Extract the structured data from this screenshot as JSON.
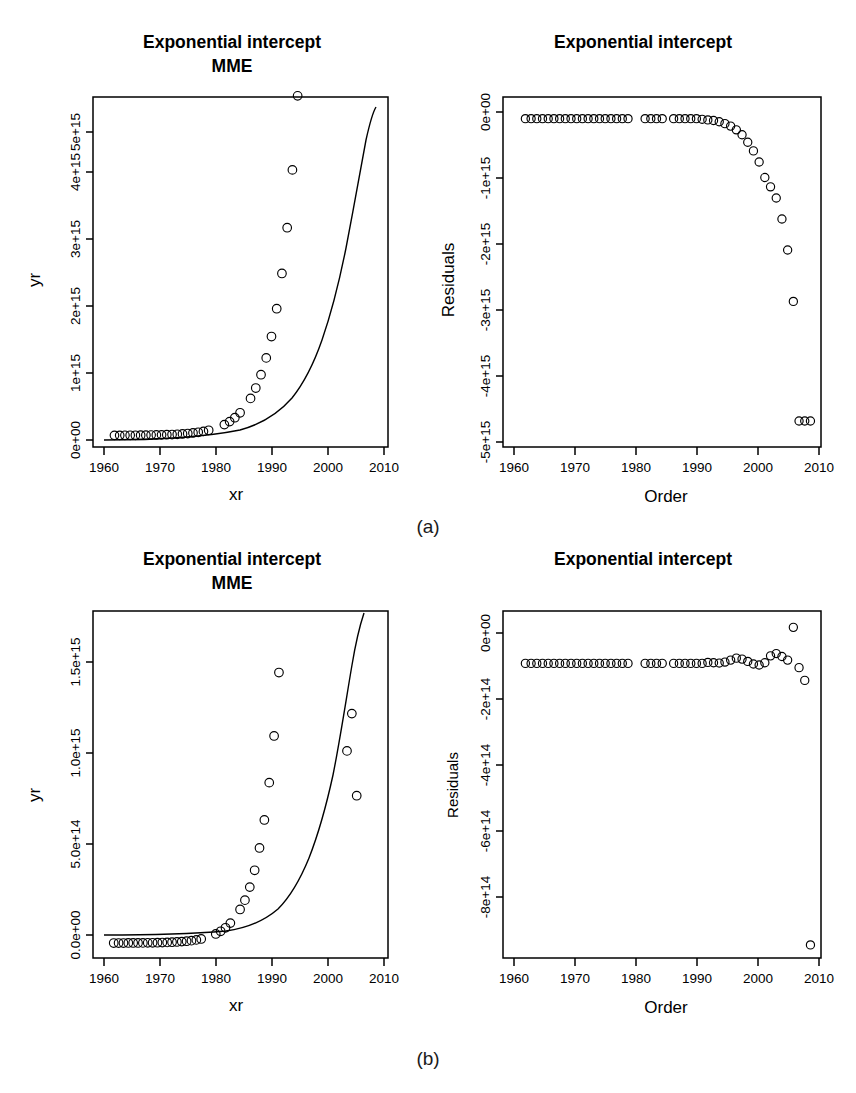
{
  "figure": {
    "subcaptions": [
      {
        "id": "a",
        "label": "(a)"
      },
      {
        "id": "b",
        "label": "(b)"
      }
    ]
  },
  "chart_data": [
    {
      "panel": "top-left",
      "type": "scatter",
      "title": "Exponential intercept\nMME",
      "title_line1": "Exponential intercept",
      "title_line2": "MME",
      "xlabel": "xr",
      "ylabel": "yr",
      "xlim": [
        1958,
        2011.5
      ],
      "ylim": [
        -200000000000000.0,
        5850000000000000.0
      ],
      "xticks": [
        1960,
        1970,
        1980,
        1990,
        2000,
        2010
      ],
      "xticklabels": [
        "1960",
        "1970",
        "1980",
        "1990",
        "2000",
        "2010"
      ],
      "yticks": [
        0,
        1000000000000000.0,
        2000000000000000.0,
        3000000000000000.0,
        4000000000000000.0,
        5000000000000000.0
      ],
      "yticklabels": [
        "0e+00",
        "1e+15",
        "2e+15",
        "3e+15",
        "4e+15",
        "5e+15"
      ],
      "grid": false,
      "legend": false,
      "series": [
        {
          "name": "observed",
          "marker": "open-circle",
          "x": [
            1960,
            1961,
            1962,
            1963,
            1964,
            1965,
            1966,
            1967,
            1968,
            1969,
            1970,
            1971,
            1972,
            1973,
            1974,
            1975,
            1976,
            1977,
            1978,
            1981,
            1982,
            1983,
            1984,
            1986,
            1987,
            1988,
            1989,
            1990,
            1991,
            1992,
            1993,
            1994,
            1995,
            1996,
            1997,
            1998,
            1999,
            2000,
            2001,
            2002,
            2003,
            2004,
            2005,
            2006,
            2007,
            2008,
            2009,
            2010
          ],
          "y": [
            1000000000000.0,
            1300000000000.0,
            1700000000000.0,
            2200000000000.0,
            2800000000000.0,
            3600000000000.0,
            4600000000000.0,
            5900000000000.0,
            7600000000000.0,
            9700000000000.0,
            12400000000000.0,
            15900000000000.0,
            20300000000000.0,
            26000000000000.0,
            33300000000000.0,
            42600000000000.0,
            54500000000000.0,
            69700000000000.0,
            89200000000000.0,
            187000000000000.0,
            239000000000000.0,
            306000000000000.0,
            391000000000000.0,
            640000000000000.0,
            819000000000000.0,
            1050000000000000.0,
            1340000000000000.0,
            1710000000000000.0,
            2190000000000000.0,
            2800000000000000.0,
            3590000000000000.0,
            4590000000000000.0,
            5870000000000000.0,
            7510000000000000.0,
            9600000000000000.0,
            1.23e+16,
            1.57e+16,
            2.01e+16,
            2.57e+16,
            3.29e+16,
            4.21e+16,
            5.38e+16,
            6.88e+16,
            8.8e+16,
            1.13e+17,
            1.44e+17,
            1.84e+17,
            2.35e+17
          ]
        }
      ],
      "fitted_curve": {
        "name": "exponential fit",
        "style": "solid-line",
        "description": "monotonically increasing exponential reaching top of panel near 2010"
      },
      "note": "Observed points fall below the fitted exponential curve after ~2005; final points diverge downward."
    },
    {
      "panel": "top-right",
      "type": "scatter",
      "title": "Exponential intercept",
      "title_line1": "Exponential intercept",
      "title_line2": "",
      "xlabel": "Order",
      "ylabel": "Residuals",
      "xlim": [
        1958,
        2011.5
      ],
      "ylim": [
        -5300000000000000.0,
        350000000000000.0
      ],
      "xticks": [
        1960,
        1970,
        1980,
        1990,
        2000,
        2010
      ],
      "xticklabels": [
        "1960",
        "1970",
        "1980",
        "1990",
        "2000",
        "2010"
      ],
      "yticks": [
        0,
        -1000000000000000.0,
        -2000000000000000.0,
        -3000000000000000.0,
        -4000000000000000.0,
        -5000000000000000.0
      ],
      "yticklabels": [
        "0e+00",
        "-1e+15",
        "-2e+15",
        "-3e+15",
        "-4e+15",
        "-5e+15"
      ],
      "grid": false,
      "legend": false,
      "series": [
        {
          "name": "residuals",
          "marker": "open-circle",
          "x": [
            1960,
            1961,
            1962,
            1963,
            1964,
            1965,
            1966,
            1967,
            1968,
            1969,
            1970,
            1971,
            1972,
            1973,
            1974,
            1975,
            1976,
            1977,
            1978,
            1981,
            1982,
            1983,
            1984,
            1986,
            1987,
            1988,
            1989,
            1990,
            1991,
            1992,
            1993,
            1994,
            1995,
            1996,
            1997,
            1998,
            1999,
            2000,
            2001,
            2002,
            2003,
            2004,
            2005,
            2006,
            2007,
            2008,
            2009,
            2010
          ],
          "y": [
            0,
            0,
            0,
            0,
            0,
            0,
            0,
            0,
            0,
            0,
            0,
            0,
            0,
            0,
            0,
            0,
            0,
            0,
            0,
            0,
            0,
            0,
            0,
            0,
            0,
            0,
            0,
            0,
            -10000000000000.0,
            -20000000000000.0,
            -30000000000000.0,
            -50000000000000.0,
            -80000000000000.0,
            -120000000000000.0,
            -180000000000000.0,
            -260000000000000.0,
            -380000000000000.0,
            -520000000000000.0,
            -700000000000000.0,
            -950000000000000.0,
            -1100000000000000.0,
            -1280000000000000.0,
            -1620000000000000.0,
            -2120000000000000.0,
            -2950000000000000.0,
            -4880000000000000.0,
            -4880000000000000.0,
            -4880000000000000.0
          ]
        }
      ],
      "note": "Residuals are flat near zero until ~1998, then curve steeply downward, reaching about -4.9e+15 at 2010."
    },
    {
      "panel": "bottom-left",
      "type": "scatter",
      "title": "Exponential intercept\nMME",
      "title_line1": "Exponential intercept",
      "title_line2": "MME",
      "xlabel": "xr",
      "ylabel": "yr",
      "xlim": [
        1958,
        2011.5
      ],
      "ylim": [
        -80000000000000.0,
        1780000000000000.0
      ],
      "xticks": [
        1960,
        1970,
        1980,
        1990,
        2000,
        2010
      ],
      "xticklabels": [
        "1960",
        "1970",
        "1980",
        "1990",
        "2000",
        "2010"
      ],
      "yticks": [
        0,
        500000000000000.0,
        1000000000000000.0,
        1500000000000000.0
      ],
      "yticklabels": [
        "0.0e+00",
        "5.0e+14",
        "1.0e+15",
        "1.5e+15"
      ],
      "grid": false,
      "legend": false,
      "series": [
        {
          "name": "observed",
          "marker": "open-circle",
          "x": [
            1960,
            1961,
            1962,
            1963,
            1964,
            1965,
            1966,
            1967,
            1968,
            1969,
            1970,
            1971,
            1972,
            1973,
            1974,
            1975,
            1976,
            1977,
            1978,
            1981,
            1982,
            1983,
            1984,
            1986,
            1987,
            1988,
            1989,
            1990,
            1991,
            1992,
            1993,
            1994,
            1995,
            1996,
            1997,
            1998,
            1999,
            2000,
            2001,
            2002,
            2003,
            2004,
            2005,
            2006,
            2007,
            2008,
            2009,
            2010
          ],
          "y": [
            200000000000.0,
            260000000000.0,
            340000000000.0,
            440000000000.0,
            570000000000.0,
            740000000000.0,
            960000000000.0,
            1250000000000.0,
            1620000000000.0,
            2100000000000.0,
            2730000000000.0,
            3550000000000.0,
            4600000000000.0,
            6000000000000.0,
            7800000000000.0,
            10000000000000.0,
            13000000000000.0,
            17000000000000.0,
            22000000000000.0,
            49000000000000.0,
            63000000000000.0,
            82000000000000.0,
            107000000000000.0,
            180000000000000.0,
            230000000000000.0,
            300000000000000.0,
            390000000000000.0,
            510000000000000.0,
            660000000000000.0,
            860000000000000.0,
            1110000000000000.0,
            1450000000000000.0,
            1880000000000000.0,
            2440000000000000.0,
            3170000000000000.0,
            4120000000000000.0,
            5350000000000000.0,
            6950000000000000.0,
            9030000000000000.0,
            1.17e+16,
            1.52e+16,
            1.98e+16,
            2.57e+16,
            3.34e+16,
            4.34e+16,
            1030000000000000.0,
            1230000000000000.0,
            790000000000000.0
          ]
        }
      ],
      "fitted_curve": {
        "name": "exponential fit",
        "style": "solid-line",
        "description": "exponential curve rising steeply from ~1990, reaching top of panel near 2009"
      },
      "note": "Observed points follow the fitted exponential closely; the last point near 2010 sits well below the curve."
    },
    {
      "panel": "bottom-right",
      "type": "scatter",
      "title": "Exponential intercept",
      "title_line1": "Exponential intercept",
      "title_line2": "",
      "xlabel": "Order",
      "ylabel": "Residuals",
      "xlim": [
        1958,
        2011.5
      ],
      "ylim": [
        -900000000000000.0,
        160000000000000.0
      ],
      "xticks": [
        1960,
        1970,
        1980,
        1990,
        2000,
        2010
      ],
      "xticklabels": [
        "1960",
        "1970",
        "1980",
        "1990",
        "2000",
        "2010"
      ],
      "yticks": [
        0,
        -200000000000000.0,
        -400000000000000.0,
        -600000000000000.0,
        -800000000000000.0
      ],
      "yticklabels": [
        "0e+00",
        "-2e+14",
        "-4e+14",
        "-6e+14",
        "-8e+14"
      ],
      "grid": false,
      "legend": false,
      "series": [
        {
          "name": "residuals",
          "marker": "open-circle",
          "x": [
            1960,
            1961,
            1962,
            1963,
            1964,
            1965,
            1966,
            1967,
            1968,
            1969,
            1970,
            1971,
            1972,
            1973,
            1974,
            1975,
            1976,
            1977,
            1978,
            1981,
            1982,
            1983,
            1984,
            1986,
            1987,
            1988,
            1989,
            1990,
            1991,
            1992,
            1993,
            1994,
            1995,
            1996,
            1997,
            1998,
            1999,
            2000,
            2001,
            2002,
            2003,
            2004,
            2005,
            2006,
            2007,
            2008,
            2009,
            2010
          ],
          "y": [
            0,
            0,
            0,
            0,
            0,
            0,
            0,
            0,
            0,
            0,
            0,
            0,
            0,
            0,
            0,
            0,
            0,
            0,
            0,
            0,
            0,
            0,
            0,
            0,
            0,
            0,
            0,
            0,
            0,
            3000000000000.0,
            2000000000000.0,
            1000000000000.0,
            4000000000000.0,
            10000000000000.0,
            16000000000000.0,
            13000000000000.0,
            6000000000000.0,
            -2000000000000.0,
            -5000000000000.0,
            2000000000000.0,
            23000000000000.0,
            30000000000000.0,
            21000000000000.0,
            10000000000000.0,
            110000000000000.0,
            -13000000000000.0,
            -52000000000000.0,
            -860000000000000.0
          ]
        }
      ],
      "note": "Residuals hover near zero with small wiggles after 1990; one high outlier near 2007 (~+1.1e+14) and a very low outlier at 2010 (~-8.6e+14)."
    }
  ]
}
